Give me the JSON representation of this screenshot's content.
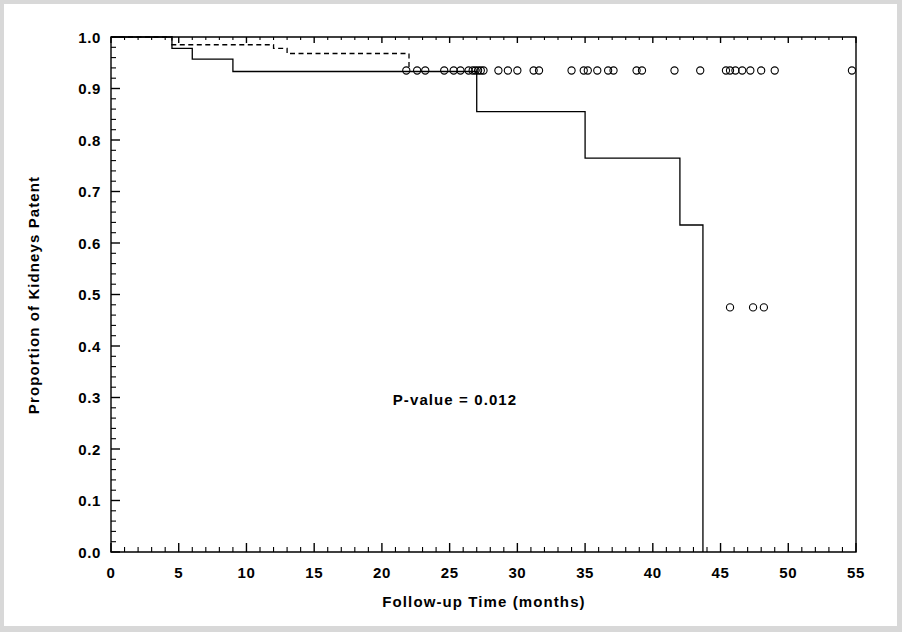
{
  "figure": {
    "background_color": "#ffffff",
    "ink_color": "#000000"
  },
  "annotation": {
    "pvalue_text": "P-value = 0.012"
  },
  "axes": {
    "x_title": "Follow-up Time (months)",
    "y_title": "Proportion of Kidneys Patent",
    "x_tick_labels": [
      "0",
      "5",
      "10",
      "15",
      "20",
      "25",
      "30",
      "35",
      "40",
      "45",
      "50",
      "55"
    ],
    "y_tick_labels": [
      "0.0",
      "0.1",
      "0.2",
      "0.3",
      "0.4",
      "0.5",
      "0.6",
      "0.7",
      "0.8",
      "0.9",
      "1.0"
    ]
  },
  "chart_data": {
    "type": "line",
    "title": "",
    "xlabel": "Follow-up Time (months)",
    "ylabel": "Proportion of Kidneys Patent",
    "xlim": [
      0,
      55
    ],
    "ylim": [
      0.0,
      1.0
    ],
    "xticks": [
      0,
      5,
      10,
      15,
      20,
      25,
      30,
      35,
      40,
      45,
      50,
      55
    ],
    "yticks": [
      0.0,
      0.1,
      0.2,
      0.3,
      0.4,
      0.5,
      0.6,
      0.7,
      0.8,
      0.9,
      1.0
    ],
    "x_minor_tick_interval": 1,
    "y_minor_tick_interval": 0.02,
    "grid": false,
    "legend": "none",
    "annotations": [
      {
        "text": "P-value = 0.012",
        "x": 25.5,
        "y": 0.315
      }
    ],
    "series": [
      {
        "name": "Group A (solid)",
        "style": "solid",
        "step": "post",
        "x": [
          0,
          4.5,
          6.0,
          9.0,
          27.0,
          35.0,
          42.0,
          43.7,
          43.7
        ],
        "y": [
          1.0,
          0.978,
          0.957,
          0.933,
          0.855,
          0.765,
          0.635,
          0.475,
          0.0
        ],
        "note": "Lower Kaplan-Meier curve; final vertical drop to the x-axis at t=43.7"
      },
      {
        "name": "Group B (dashed)",
        "style": "dashed",
        "step": "post",
        "x": [
          0,
          4.5,
          12.0,
          13.0,
          21.8,
          22.0
        ],
        "y": [
          1.0,
          0.985,
          0.978,
          0.968,
          0.968,
          0.935
        ],
        "note": "Upper Kaplan-Meier curve; merges with the lower curve level at about t=22"
      },
      {
        "name": "Censored observations (upper level)",
        "style": "open-circle-markers",
        "marker_y": 0.935,
        "x": [
          21.8,
          22.6,
          23.2,
          24.6,
          25.3,
          25.8,
          26.4,
          26.7,
          26.9,
          27.1,
          27.3,
          27.5,
          28.6,
          29.3,
          30.0,
          31.2,
          31.6,
          34.0,
          34.9,
          35.2,
          35.9,
          36.7,
          37.1,
          38.8,
          39.2,
          41.6,
          43.5,
          45.4,
          45.7,
          46.1,
          46.6,
          47.2,
          48.0,
          49.0,
          54.7
        ]
      },
      {
        "name": "Censored observations (lower level)",
        "style": "open-circle-markers",
        "marker_y": 0.475,
        "x": [
          45.7,
          47.4,
          48.2
        ]
      }
    ]
  }
}
